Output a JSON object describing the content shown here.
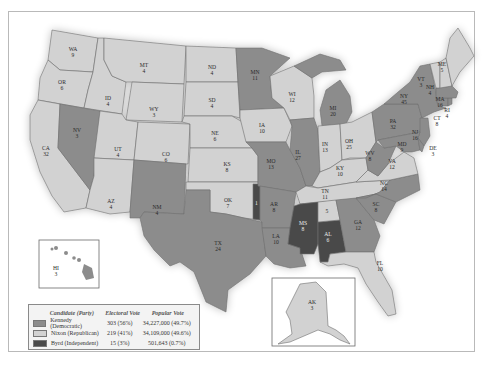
{
  "map": {
    "title": "1960 Presidential Election",
    "colors": {
      "kennedy": "#8c8c8c",
      "nixon": "#d2d2d2",
      "byrd": "#4a4a4a"
    },
    "states": [
      {
        "abbr": "WA",
        "ev": "9",
        "winner": "nixon"
      },
      {
        "abbr": "OR",
        "ev": "6",
        "winner": "nixon"
      },
      {
        "abbr": "CA",
        "ev": "32",
        "winner": "nixon"
      },
      {
        "abbr": "ID",
        "ev": "4",
        "winner": "nixon"
      },
      {
        "abbr": "NV",
        "ev": "3",
        "winner": "kennedy"
      },
      {
        "abbr": "MT",
        "ev": "4",
        "winner": "nixon"
      },
      {
        "abbr": "WY",
        "ev": "3",
        "winner": "nixon"
      },
      {
        "abbr": "UT",
        "ev": "4",
        "winner": "nixon"
      },
      {
        "abbr": "AZ",
        "ev": "4",
        "winner": "nixon"
      },
      {
        "abbr": "CO",
        "ev": "6",
        "winner": "nixon"
      },
      {
        "abbr": "NM",
        "ev": "4",
        "winner": "kennedy"
      },
      {
        "abbr": "ND",
        "ev": "4",
        "winner": "nixon"
      },
      {
        "abbr": "SD",
        "ev": "4",
        "winner": "nixon"
      },
      {
        "abbr": "NE",
        "ev": "6",
        "winner": "nixon"
      },
      {
        "abbr": "KS",
        "ev": "8",
        "winner": "nixon"
      },
      {
        "abbr": "OK",
        "ev": "7",
        "winner": "nixon"
      },
      {
        "abbr": "TX",
        "ev": "24",
        "winner": "kennedy"
      },
      {
        "abbr": "MN",
        "ev": "11",
        "winner": "kennedy"
      },
      {
        "abbr": "IA",
        "ev": "10",
        "winner": "nixon"
      },
      {
        "abbr": "MO",
        "ev": "13",
        "winner": "kennedy"
      },
      {
        "abbr": "AR",
        "ev": "8",
        "winner": "kennedy"
      },
      {
        "abbr": "LA",
        "ev": "10",
        "winner": "kennedy"
      },
      {
        "abbr": "WI",
        "ev": "12",
        "winner": "nixon"
      },
      {
        "abbr": "IL",
        "ev": "27",
        "winner": "kennedy"
      },
      {
        "abbr": "MI",
        "ev": "20",
        "winner": "kennedy"
      },
      {
        "abbr": "IN",
        "ev": "13",
        "winner": "nixon"
      },
      {
        "abbr": "OH",
        "ev": "25",
        "winner": "nixon"
      },
      {
        "abbr": "KY",
        "ev": "10",
        "winner": "nixon"
      },
      {
        "abbr": "TN",
        "ev": "11",
        "winner": "nixon"
      },
      {
        "abbr": "MS",
        "ev": "8",
        "winner": "byrd"
      },
      {
        "abbr": "AL",
        "ev": "6",
        "winner": "byrd"
      },
      {
        "abbr": "GA",
        "ev": "12",
        "winner": "kennedy"
      },
      {
        "abbr": "FL",
        "ev": "10",
        "winner": "nixon"
      },
      {
        "abbr": "SC",
        "ev": "8",
        "winner": "kennedy"
      },
      {
        "abbr": "NC",
        "ev": "14",
        "winner": "kennedy"
      },
      {
        "abbr": "VA",
        "ev": "12",
        "winner": "nixon"
      },
      {
        "abbr": "WV",
        "ev": "8",
        "winner": "kennedy"
      },
      {
        "abbr": "PA",
        "ev": "32",
        "winner": "kennedy"
      },
      {
        "abbr": "NY",
        "ev": "45",
        "winner": "kennedy"
      },
      {
        "abbr": "NJ",
        "ev": "16",
        "winner": "kennedy"
      },
      {
        "abbr": "MD",
        "ev": "9",
        "winner": "kennedy"
      },
      {
        "abbr": "DE",
        "ev": "3",
        "winner": "kennedy"
      },
      {
        "abbr": "CT",
        "ev": "8",
        "winner": "kennedy"
      },
      {
        "abbr": "RI",
        "ev": "4",
        "winner": "kennedy"
      },
      {
        "abbr": "MA",
        "ev": "16",
        "winner": "kennedy"
      },
      {
        "abbr": "VT",
        "ev": "3",
        "winner": "nixon"
      },
      {
        "abbr": "NH",
        "ev": "4",
        "winner": "nixon"
      },
      {
        "abbr": "ME",
        "ev": "5",
        "winner": "nixon"
      },
      {
        "abbr": "AK",
        "ev": "3",
        "winner": "nixon"
      },
      {
        "abbr": "HI",
        "ev": "3",
        "winner": "kennedy"
      }
    ],
    "split_labels": {
      "al_unpledged": "5",
      "ok_byrd": "1"
    }
  },
  "legend": {
    "headers": {
      "candidate": "Candidate (Party)",
      "electoral": "Electoral Vote",
      "popular": "Popular Vote"
    },
    "rows": [
      {
        "candidate": "Kennedy (Democratic)",
        "electoral": "303 (56%)",
        "popular": "34,227,000 (49.7%)",
        "color": "#8c8c8c"
      },
      {
        "candidate": "Nixon (Republican)",
        "electoral": "219 (41%)",
        "popular": "34,109,000 (49.6%)",
        "color": "#d2d2d2"
      },
      {
        "candidate": "Byrd (Independent)",
        "electoral": "15 (3%)",
        "popular": "501,643 (0.7%)",
        "color": "#4a4a4a"
      }
    ]
  }
}
